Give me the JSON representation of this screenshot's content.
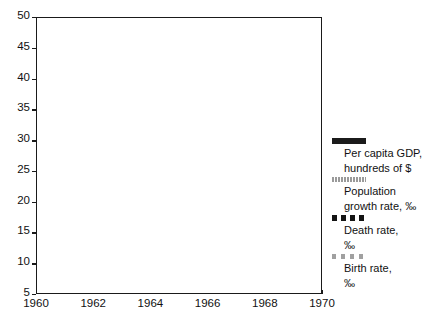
{
  "chart_data": {
    "type": "line",
    "title": "",
    "xlabel": "",
    "ylabel": "",
    "xlim": [
      1960,
      1970
    ],
    "ylim": [
      5,
      50
    ],
    "grid": false,
    "legend_position": "right",
    "x": [
      1960,
      1960.5,
      1961,
      1961.5,
      1962,
      1962.5,
      1963,
      1963.5,
      1964,
      1964.5,
      1965,
      1965.5,
      1966,
      1966.5,
      1967,
      1967.5,
      1968,
      1968.5,
      1969,
      1969.5,
      1970
    ],
    "xticks": [
      "1960",
      "1962",
      "1964",
      "1966",
      "1968",
      "1970"
    ],
    "xtick_values": [
      1960,
      1962,
      1964,
      1966,
      1968,
      1970
    ],
    "yticks": [
      "5",
      "10",
      "15",
      "20",
      "25",
      "30",
      "35",
      "40",
      "45",
      "50"
    ],
    "ytick_values": [
      5,
      10,
      15,
      20,
      25,
      30,
      35,
      40,
      45,
      50
    ],
    "series": [
      {
        "name": "Per capita GDP, hundreds of $",
        "style": "solid-thick-dark",
        "color": "#1b1b1b",
        "values": [
          8.4,
          8.45,
          8.5,
          8.55,
          8.6,
          8.65,
          8.7,
          8.75,
          8.8,
          8.85,
          8.95,
          9.05,
          9.15,
          9.3,
          9.5,
          9.7,
          9.95,
          10.2,
          10.5,
          10.9,
          11.3
        ]
      },
      {
        "name": "Population growth rate, ‰",
        "style": "dotted-gray",
        "color": "#8f8f8f",
        "values": [
          15.35,
          15.5,
          15.65,
          15.8,
          15.95,
          16.1,
          16.25,
          16.4,
          16.55,
          16.7,
          16.85,
          17.0,
          17.15,
          17.3,
          17.45,
          17.6,
          17.8,
          18.0,
          18.25,
          18.55,
          18.9
        ]
      },
      {
        "name": "Death rate, ‰",
        "style": "dashed-dark",
        "color": "#141414",
        "values": [
          32.8,
          32.7,
          32.6,
          32.5,
          32.4,
          32.3,
          32.15,
          32.0,
          31.85,
          31.7,
          31.5,
          31.3,
          31.1,
          30.9,
          30.7,
          30.5,
          30.35,
          30.2,
          30.05,
          29.9,
          29.7
        ]
      },
      {
        "name": "Birth rate, ‰",
        "style": "dashed-gray",
        "color": "#a0a0a0",
        "values": [
          48.3,
          48.3,
          48.3,
          48.3,
          48.3,
          48.3,
          48.3,
          48.3,
          48.3,
          48.3,
          48.35,
          48.35,
          48.35,
          48.35,
          48.35,
          48.35,
          48.4,
          48.4,
          48.4,
          48.4,
          48.4
        ]
      }
    ]
  },
  "legend": {
    "entries": [
      {
        "swatch": "solid-thick-dark",
        "line1": "Per capita GDP,",
        "line2": "hundreds of $"
      },
      {
        "swatch": "dotted-gray",
        "line1": "Population",
        "line2": "growth rate, ‰"
      },
      {
        "swatch": "dashed-dark",
        "line1": "Death rate,",
        "line2": "‰"
      },
      {
        "swatch": "dashed-gray",
        "line1": "Birth rate,",
        "line2": "‰"
      }
    ]
  },
  "axes": {
    "y_labels": [
      "50",
      "45",
      "40",
      "35",
      "30",
      "25",
      "20",
      "15",
      "10",
      "5"
    ],
    "x_labels": [
      "1960",
      "1962",
      "1964",
      "1966",
      "1968",
      "1970"
    ]
  }
}
